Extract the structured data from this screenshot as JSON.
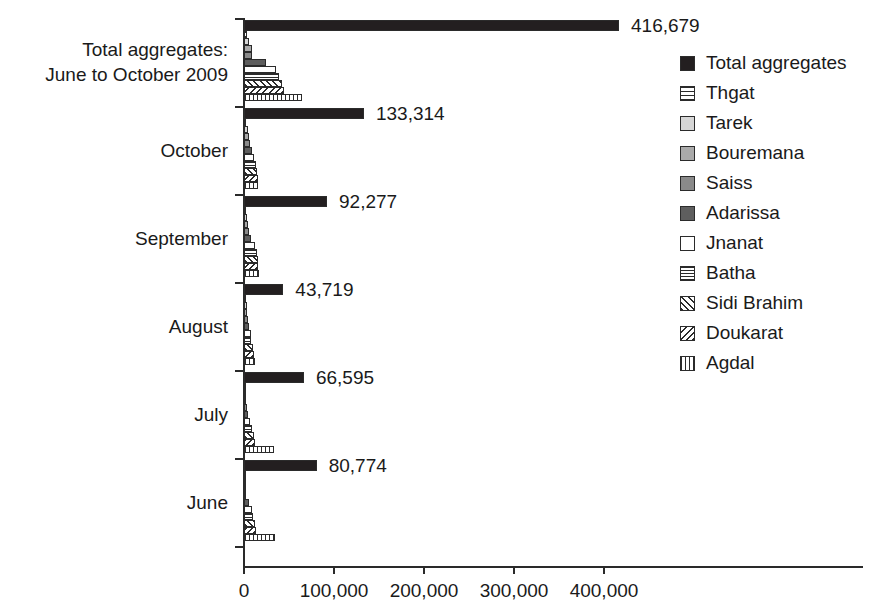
{
  "chart_data": {
    "type": "bar",
    "orientation": "horizontal",
    "title": "",
    "xlabel": "",
    "ylabel": "",
    "xlim": [
      0,
      420000
    ],
    "xticks": [
      0,
      100000,
      200000,
      300000,
      400000
    ],
    "xtick_labels": [
      "0",
      "100,000",
      "200,000",
      "300,000",
      "400,000"
    ],
    "grid": false,
    "legend_position": "right",
    "categories": [
      "Total aggregates:\nJune to October 2009",
      "October",
      "September",
      "August",
      "July",
      "June"
    ],
    "series": [
      {
        "name": "Total aggregates",
        "pattern": "solid-black",
        "values": [
          416679,
          133314,
          92277,
          43719,
          66595,
          80774
        ]
      },
      {
        "name": "Thgat",
        "pattern": "hline-wide",
        "values": [
          3300,
          1100,
          900,
          600,
          400,
          300
        ]
      },
      {
        "name": "Tarek",
        "pattern": "light-grey",
        "values": [
          5600,
          4400,
          3300,
          2800,
          1700,
          1100
        ]
      },
      {
        "name": "Bouremana",
        "pattern": "mid-grey",
        "values": [
          8900,
          5600,
          4400,
          3300,
          2200,
          1700
        ]
      },
      {
        "name": "Saiss",
        "pattern": "dark-grey",
        "values": [
          9400,
          6700,
          5000,
          3900,
          2800,
          2200
        ]
      },
      {
        "name": "Adarissa",
        "pattern": "darker-grey",
        "values": [
          24400,
          8900,
          7800,
          6100,
          3900,
          6100
        ]
      },
      {
        "name": "Jnanat",
        "pattern": "white",
        "values": [
          35600,
          11100,
          12200,
          7800,
          7200,
          9400
        ]
      },
      {
        "name": "Batha",
        "pattern": "hline-tight",
        "values": [
          38900,
          12800,
          13900,
          8300,
          8900,
          10000
        ]
      },
      {
        "name": "Sidi Brahim",
        "pattern": "diag-fwd",
        "values": [
          42200,
          14400,
          15600,
          10000,
          10600,
          11700
        ]
      },
      {
        "name": "Doukarat",
        "pattern": "diag-back",
        "values": [
          44400,
          15000,
          16100,
          11100,
          11700,
          13300
        ]
      },
      {
        "name": "Agdal",
        "pattern": "vline",
        "values": [
          64400,
          15600,
          16700,
          11700,
          33300,
          34400
        ]
      }
    ],
    "value_labels": [
      "416,679",
      "133,314",
      "92,277",
      "43,719",
      "66,595",
      "80,774"
    ]
  },
  "legend": {
    "items": [
      {
        "label": "Total aggregates",
        "pattern": "solid-black"
      },
      {
        "label": "Thgat",
        "pattern": "hline-wide"
      },
      {
        "label": "Tarek",
        "pattern": "light-grey"
      },
      {
        "label": "Bouremana",
        "pattern": "mid-grey"
      },
      {
        "label": "Saiss",
        "pattern": "dark-grey"
      },
      {
        "label": "Adarissa",
        "pattern": "darker-grey"
      },
      {
        "label": "Jnanat",
        "pattern": "white"
      },
      {
        "label": "Batha",
        "pattern": "hline-tight"
      },
      {
        "label": "Sidi Brahim",
        "pattern": "diag-fwd"
      },
      {
        "label": "Doukarat",
        "pattern": "diag-back"
      },
      {
        "label": "Agdal",
        "pattern": "vline"
      }
    ]
  },
  "colors": {
    "axis": "#2a2a2a",
    "text": "#1a1a1a",
    "background": "#ffffff",
    "bar_outline": "#2b2b2b"
  }
}
